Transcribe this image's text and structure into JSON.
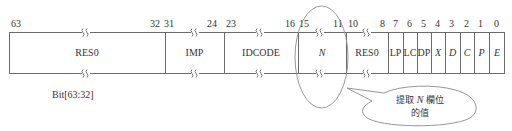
{
  "register": {
    "fields": [
      {
        "name": "RES0",
        "hi": 63,
        "lo": 32,
        "italic": false,
        "left": 9,
        "width": 156
      },
      {
        "name": "IMP",
        "hi": 31,
        "lo": 24,
        "italic": false,
        "left": 165,
        "width": 59
      },
      {
        "name": "IDCODE",
        "hi": 23,
        "lo": 16,
        "italic": false,
        "left": 224,
        "width": 74
      },
      {
        "name": "N",
        "hi": 15,
        "lo": 11,
        "italic": true,
        "left": 298,
        "width": 48
      },
      {
        "name": "RES0",
        "hi": 10,
        "lo": 8,
        "italic": false,
        "left": 346,
        "width": 42
      },
      {
        "name": "LP",
        "hi": 7,
        "lo": 7,
        "italic": false,
        "left": 388,
        "width": 15
      },
      {
        "name": "LC",
        "hi": 6,
        "lo": 6,
        "italic": false,
        "left": 403,
        "width": 14
      },
      {
        "name": "DP",
        "hi": 5,
        "lo": 5,
        "italic": false,
        "left": 417,
        "width": 14
      },
      {
        "name": "X",
        "hi": 4,
        "lo": 4,
        "italic": true,
        "left": 431,
        "width": 14
      },
      {
        "name": "D",
        "hi": 3,
        "lo": 3,
        "italic": true,
        "left": 445,
        "width": 15
      },
      {
        "name": "C",
        "hi": 2,
        "lo": 2,
        "italic": true,
        "left": 460,
        "width": 14
      },
      {
        "name": "P",
        "hi": 1,
        "lo": 1,
        "italic": true,
        "left": 474,
        "width": 15
      },
      {
        "name": "E",
        "hi": 0,
        "lo": 0,
        "italic": true,
        "left": 489,
        "width": 16
      }
    ],
    "bit_labels": [
      {
        "text": "63",
        "x": 11
      },
      {
        "text": "32",
        "x": 150
      },
      {
        "text": "31",
        "x": 164
      },
      {
        "text": "24",
        "x": 207
      },
      {
        "text": "23",
        "x": 226
      },
      {
        "text": "16",
        "x": 285
      },
      {
        "text": "15",
        "x": 299
      },
      {
        "text": "11",
        "x": 333
      },
      {
        "text": "10",
        "x": 348
      },
      {
        "text": "8",
        "x": 380
      },
      {
        "text": "7",
        "x": 393
      },
      {
        "text": "6",
        "x": 407
      },
      {
        "text": "5",
        "x": 421
      },
      {
        "text": "4",
        "x": 435
      },
      {
        "text": "3",
        "x": 449
      },
      {
        "text": "2",
        "x": 464
      },
      {
        "text": "1",
        "x": 478
      },
      {
        "text": "0",
        "x": 494
      }
    ],
    "caption": "Bit[63:32]"
  },
  "callout": {
    "line1_prefix": "提取",
    "line1_var": "N",
    "line1_suffix": "欄位",
    "line2": "的值"
  },
  "colors": {
    "line": "#6b6b6b",
    "text": "#333333"
  }
}
